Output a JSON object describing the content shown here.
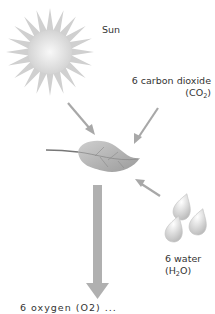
{
  "diagram": {
    "sun": {
      "label": "Sun"
    },
    "carbon_dioxide": {
      "label": "6 carbon dioxide",
      "formula_prefix": "(CO",
      "formula_sub": "2",
      "formula_suffix": ")"
    },
    "water": {
      "label": "6 water",
      "formula_prefix": "(H",
      "formula_sub": "2",
      "formula_suffix": "O)"
    },
    "output_label_clipped": "6 oxygen (O2) ...",
    "colors": {
      "arrow": "#a8a8a8",
      "sun_core": "#ececec",
      "sun_rays": "#c9c9c9",
      "leaf": "#b5b5b5",
      "leaf_vein": "#8a8a8a",
      "water_drop": "#d8d8d8",
      "text": "#333333"
    }
  }
}
